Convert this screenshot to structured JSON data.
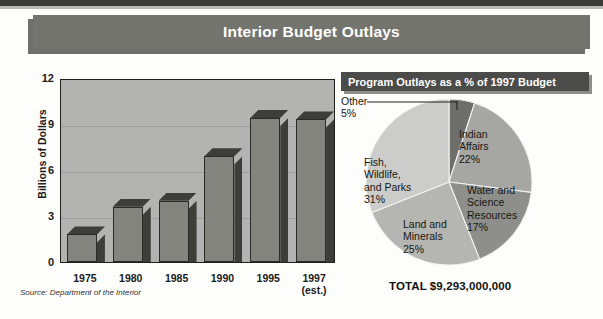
{
  "title": "Interior Budget Outlays",
  "source_note": "Source: Department of the Interior",
  "pie_header": "Program Outlays as a % of 1997 Budget",
  "pie_total": "TOTAL $9,293,000,000",
  "colors": {
    "title_bar": "#74746f",
    "pie_header_bar": "#4b4b49",
    "plot_bg": "#b3b3b1",
    "bar_front": "#84847f",
    "bar_shade": "#3d3d3a"
  },
  "chart_data": [
    {
      "type": "bar",
      "title": "Interior Budget Outlays",
      "categories": [
        "1975",
        "1980",
        "1985",
        "1990",
        "1995",
        "1997\n(est.)"
      ],
      "category_labels": [
        {
          "line1": "1975",
          "line2": ""
        },
        {
          "line1": "1980",
          "line2": ""
        },
        {
          "line1": "1985",
          "line2": ""
        },
        {
          "line1": "1990",
          "line2": ""
        },
        {
          "line1": "1995",
          "line2": ""
        },
        {
          "line1": "1997",
          "line2": "(est.)"
        }
      ],
      "values": [
        1.8,
        3.6,
        4.0,
        6.9,
        9.4,
        9.3
      ],
      "xlabel": "",
      "ylabel": "Billions of Dollars",
      "ylim": [
        0,
        12
      ],
      "yticks": [
        0,
        3,
        6,
        9,
        12
      ],
      "grid": true,
      "legend": "none"
    },
    {
      "type": "pie",
      "title": "Program Outlays as a % of 1997 Budget",
      "total": "TOTAL $9,293,000,000",
      "labels": [
        "Fish, Wildlife, and Parks",
        "Land and Minerals",
        "Water and Science Resources",
        "Indian Affairs",
        "Other"
      ],
      "values": [
        31,
        25,
        17,
        22,
        5
      ],
      "slices": [
        {
          "name": "Other",
          "pct": "5%",
          "label_line1": "Other",
          "label_line2": "5%",
          "color": "#6e6e6b"
        },
        {
          "name": "Indian Affairs",
          "pct": "22%",
          "label_line1": "Indian",
          "label_line2": "Affairs",
          "label_line3": "22%",
          "color": "#a6a6a3"
        },
        {
          "name": "Water and Science Resources",
          "pct": "17%",
          "label_line1": "Water and",
          "label_line2": "Science",
          "label_line3": "Resources",
          "label_line4": "17%",
          "color": "#8e8e8b"
        },
        {
          "name": "Land and Minerals",
          "pct": "25%",
          "label_line1": "Land and",
          "label_line2": "Minerals",
          "label_line3": "25%",
          "color": "#b5b5b2"
        },
        {
          "name": "Fish, Wildlife, and Parks",
          "pct": "31%",
          "label_line1": "Fish,",
          "label_line2": "Wildlife,",
          "label_line3": "and Parks",
          "label_line4": "31%",
          "color": "#cccccA"
        }
      ]
    }
  ]
}
